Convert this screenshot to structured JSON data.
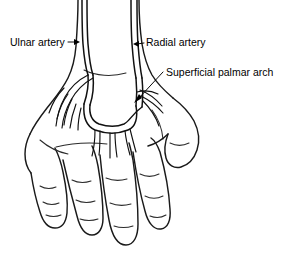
{
  "diagram": {
    "background_color": "#ffffff",
    "line_color": "#1a1a1a",
    "view": "palmar surface of right hand and distal forearm, line drawing",
    "labels": [
      {
        "id": "ulnar-artery",
        "text": "Ulnar artery",
        "text_x": 10,
        "text_y": 46,
        "anchor": "start",
        "leader_from_x": 68,
        "leader_from_y": 42,
        "leader_to_x": 80,
        "leader_to_y": 42,
        "arrow_direction": "right"
      },
      {
        "id": "radial-artery",
        "text": "Radial artery",
        "text_x": 146,
        "text_y": 46,
        "anchor": "start",
        "leader_from_x": 144,
        "leader_from_y": 42,
        "leader_to_x": 133,
        "leader_to_y": 44,
        "arrow_direction": "left"
      },
      {
        "id": "superficial-palmar-arch",
        "text": "Superficial palmar arch",
        "text_x": 166,
        "text_y": 76,
        "anchor": "start",
        "leader_from_x": 164,
        "leader_from_y": 72,
        "leader_to_x": 134,
        "leader_to_y": 101,
        "arrow_direction": "down-left"
      }
    ],
    "structures": [
      {
        "id": "ulnar-artery",
        "name": "Ulnar artery",
        "side": "left-of-image",
        "enters_at": "top edge near x=83"
      },
      {
        "id": "radial-artery",
        "name": "Radial artery",
        "side": "right-of-image",
        "enters_at": "top edge near x=134"
      },
      {
        "id": "superficial-palmar-arch",
        "name": "Superficial palmar arch",
        "shape": "U-shaped loop across mid palm"
      },
      {
        "id": "common-digital-arteries",
        "name": "Common digital arteries",
        "count": 4
      },
      {
        "id": "thumb",
        "name": "Thumb",
        "position": "right side, abducted"
      },
      {
        "id": "fingers",
        "name": "Fingers",
        "count": 4
      }
    ]
  }
}
